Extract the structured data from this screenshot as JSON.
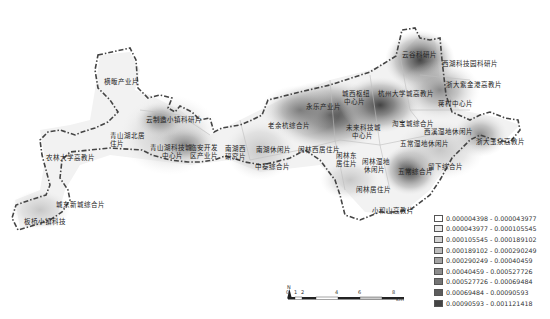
{
  "map": {
    "type": "kernel-density heat map",
    "labels": [
      {
        "id": "hengpan",
        "text": "横畈产业片",
        "x": 104,
        "y": 78
      },
      {
        "id": "yunzhi",
        "text": "云制造小镇科研片",
        "x": 146,
        "y": 116
      },
      {
        "id": "qingshanhu-north",
        "text": "青山湖北居",
        "x": 110,
        "y": 132
      },
      {
        "id": "qingshanhu-north-2",
        "text": "住片",
        "x": 110,
        "y": 140
      },
      {
        "id": "nonglin",
        "text": "农林大学高教片",
        "x": 46,
        "y": 154
      },
      {
        "id": "qingshanhu-tech",
        "text": "青山湖科技城",
        "x": 150,
        "y": 144
      },
      {
        "id": "qingshanhu-tech-2",
        "text": "中心片",
        "x": 162,
        "y": 152
      },
      {
        "id": "lingan",
        "text": "临安开发",
        "x": 190,
        "y": 144
      },
      {
        "id": "lingan-2",
        "text": "区产业片",
        "x": 190,
        "y": 152
      },
      {
        "id": "chengdong",
        "text": "城东新城综合片",
        "x": 56,
        "y": 201
      },
      {
        "id": "banxi",
        "text": "板桥小镇科技",
        "x": 24,
        "y": 218
      },
      {
        "id": "nanhuxi",
        "text": "南湖西",
        "x": 225,
        "y": 145
      },
      {
        "id": "nanhuxi-2",
        "text": "研究片",
        "x": 225,
        "y": 153
      },
      {
        "id": "laoyu",
        "text": "老余杭综合片",
        "x": 268,
        "y": 122
      },
      {
        "id": "yongle",
        "text": "永乐产业片",
        "x": 306,
        "y": 103
      },
      {
        "id": "chengxi",
        "text": "城西枢纽",
        "x": 342,
        "y": 90
      },
      {
        "id": "chengxi-2",
        "text": "中心片",
        "x": 344,
        "y": 98
      },
      {
        "id": "hzu",
        "text": "杭州大学城高教片",
        "x": 378,
        "y": 90
      },
      {
        "id": "weilai",
        "text": "未来科技城",
        "x": 346,
        "y": 124
      },
      {
        "id": "weilai-2",
        "text": "中心片",
        "x": 352,
        "y": 132
      },
      {
        "id": "haobao",
        "text": "淘宝城综合片",
        "x": 392,
        "y": 120
      },
      {
        "id": "nanhu-leisure",
        "text": "南湖休闲片",
        "x": 256,
        "y": 146
      },
      {
        "id": "xianlin-west",
        "text": "闲林西居住片",
        "x": 298,
        "y": 146
      },
      {
        "id": "zhongtai",
        "text": "中泰综合片",
        "x": 255,
        "y": 163
      },
      {
        "id": "xianlin-east",
        "text": "闲林东",
        "x": 336,
        "y": 152
      },
      {
        "id": "xianlin-east-2",
        "text": "居住片",
        "x": 336,
        "y": 160
      },
      {
        "id": "xianlin-wet",
        "text": "闲林湿地",
        "x": 362,
        "y": 158
      },
      {
        "id": "xianlin-wet-2",
        "text": "休闲片",
        "x": 364,
        "y": 166
      },
      {
        "id": "wuchang-wet",
        "text": "五常湿地休闲片",
        "x": 400,
        "y": 140
      },
      {
        "id": "wuchang",
        "text": "五常综合片",
        "x": 398,
        "y": 168
      },
      {
        "id": "liuxia",
        "text": "留下综合片",
        "x": 428,
        "y": 163
      },
      {
        "id": "xianlin-res",
        "text": "闲林居住片",
        "x": 356,
        "y": 186
      },
      {
        "id": "xiaoheshan",
        "text": "小和山高教片",
        "x": 372,
        "y": 207
      },
      {
        "id": "yungu",
        "text": "云谷科研片",
        "x": 402,
        "y": 51
      },
      {
        "id": "xihu-school",
        "text": "西湖科技园科研片",
        "x": 442,
        "y": 60
      },
      {
        "id": "zju-zijingang",
        "text": "浙大紫金港高教片",
        "x": 446,
        "y": 81
      },
      {
        "id": "jiangcun",
        "text": "蒋村中心片",
        "x": 438,
        "y": 100
      },
      {
        "id": "xixi-wet",
        "text": "西溪湿地休闲片",
        "x": 424,
        "y": 128
      },
      {
        "id": "zju-yuquan",
        "text": "浙大玉泉高教片",
        "x": 476,
        "y": 138
      }
    ]
  },
  "legend": {
    "items": [
      {
        "range": "0.000004398 - 0.000043977",
        "color": "#ffffff"
      },
      {
        "range": "0.000043977 - 0.000105545",
        "color": "#e8e8e8"
      },
      {
        "range": "0.000105545 - 0.000189102",
        "color": "#d2d2d2"
      },
      {
        "range": "0.000189102 - 0.000290249",
        "color": "#bcbcbc"
      },
      {
        "range": "0.000290249 - 0.00040459",
        "color": "#a4a4a4"
      },
      {
        "range": "0.00040459 - 0.000527726",
        "color": "#8c8c8c"
      },
      {
        "range": "0.000527726 - 0.00069484",
        "color": "#747474"
      },
      {
        "range": "0.00069484 - 0.00090593",
        "color": "#5c5c5c"
      },
      {
        "range": "0.00090593 - 0.001121418",
        "color": "#444444"
      }
    ]
  },
  "scale_bar": {
    "ticks": [
      "0",
      "1",
      "2",
      "4",
      "6",
      "8"
    ],
    "unit": "km"
  },
  "north_arrow": {
    "label": "N"
  }
}
